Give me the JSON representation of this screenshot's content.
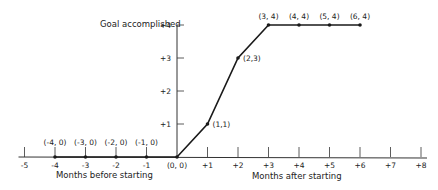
{
  "chart_data": {
    "type": "line",
    "title": "",
    "ylabel": "Goal accomplished",
    "xlabel_left": "Months before starting",
    "xlabel_right": "Months after starting",
    "x_ticks": [
      -5,
      -4,
      -3,
      -2,
      -1,
      0,
      1,
      2,
      3,
      4,
      5,
      6,
      7,
      8
    ],
    "x_tick_labels": [
      "-5",
      "-4",
      "-3",
      "-2",
      "-1",
      "",
      "+1",
      "+2",
      "+3",
      "+4",
      "+5",
      "+6",
      "+7",
      "+8"
    ],
    "y_ticks": [
      1,
      2,
      3,
      4
    ],
    "y_tick_labels": [
      "+1",
      "+2",
      "+3",
      "+4"
    ],
    "xlim": [
      -5,
      8
    ],
    "ylim": [
      0,
      4
    ],
    "grid": false,
    "legend": null,
    "series": [
      {
        "name": "Goal progress",
        "x": [
          -4,
          -3,
          -2,
          -1,
          0,
          1,
          2,
          3,
          4,
          5,
          6
        ],
        "y": [
          0,
          0,
          0,
          0,
          0,
          1,
          3,
          4,
          4,
          4,
          4
        ],
        "labels": [
          "(-4, 0)",
          "(-3, 0)",
          "(-2, 0)",
          "(-1, 0)",
          "(0, 0)",
          "(1,1)",
          "(2,3)",
          "(3, 4)",
          "(4, 4)",
          "(5, 4)",
          "(6, 4)"
        ]
      }
    ],
    "colors": {
      "line": "#1a1a1a",
      "axis": "#333333",
      "text": "#222222"
    }
  }
}
